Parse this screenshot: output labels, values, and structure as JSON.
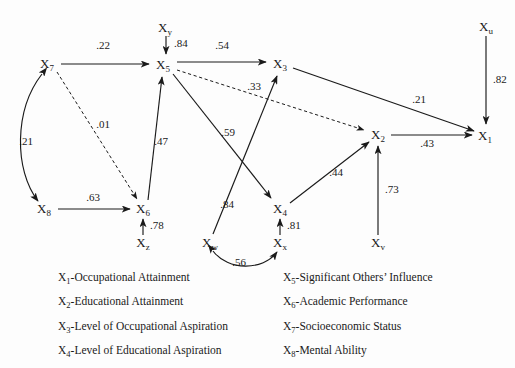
{
  "diagram": {
    "nodes": [
      {
        "id": "X1",
        "base": "X",
        "sub": "1",
        "x": 485,
        "y": 136
      },
      {
        "id": "X2",
        "base": "X",
        "sub": "2",
        "x": 378,
        "y": 135
      },
      {
        "id": "X3",
        "base": "X",
        "sub": "3",
        "x": 280,
        "y": 64
      },
      {
        "id": "X4",
        "base": "X",
        "sub": "4",
        "x": 280,
        "y": 209
      },
      {
        "id": "X5",
        "base": "X",
        "sub": "5",
        "x": 163,
        "y": 65
      },
      {
        "id": "X6",
        "base": "X",
        "sub": "6",
        "x": 143,
        "y": 209
      },
      {
        "id": "X7",
        "base": "X",
        "sub": "7",
        "x": 47,
        "y": 64
      },
      {
        "id": "X8",
        "base": "X",
        "sub": "8",
        "x": 44,
        "y": 209
      },
      {
        "id": "Xu",
        "base": "X",
        "sub": "u",
        "x": 486,
        "y": 27
      },
      {
        "id": "Xv",
        "base": "X",
        "sub": "v",
        "x": 378,
        "y": 243
      },
      {
        "id": "Xw",
        "base": "X",
        "sub": "w",
        "x": 210,
        "y": 243
      },
      {
        "id": "Xx",
        "base": "X",
        "sub": "x",
        "x": 280,
        "y": 243
      },
      {
        "id": "Xy",
        "base": "X",
        "sub": "y",
        "x": 165,
        "y": 28
      },
      {
        "id": "Xz",
        "base": "X",
        "sub": "z",
        "x": 143,
        "y": 243
      }
    ],
    "edges": [
      {
        "from": "X7",
        "to": "X5",
        "coefficient": ".22",
        "style": "solid",
        "arrow": "single",
        "label_x": 103,
        "label_y": 49
      },
      {
        "from": "Xy",
        "to": "X5",
        "coefficient": ".84",
        "style": "solid",
        "arrow": "single",
        "label_x": 174,
        "label_y": 47
      },
      {
        "from": "X5",
        "to": "X3",
        "coefficient": ".54",
        "style": "solid",
        "arrow": "single",
        "label_x": 222,
        "label_y": 49
      },
      {
        "from": "X5",
        "to": "X2",
        "coefficient": ".33",
        "style": "dashed",
        "arrow": "single",
        "label_x": 254,
        "label_y": 90
      },
      {
        "from": "X5",
        "to": "X4",
        "coefficient": ".59",
        "style": "solid",
        "arrow": "single",
        "label_x": 228,
        "label_y": 136
      },
      {
        "from": "X6",
        "to": "X5",
        "coefficient": ".47",
        "style": "solid",
        "arrow": "single",
        "label_x": 161,
        "label_y": 145
      },
      {
        "from": "X7",
        "to": "X6",
        "coefficient": ".01",
        "style": "dashed",
        "arrow": "single",
        "label_x": 103,
        "label_y": 128
      },
      {
        "from": "X7",
        "to": "X8",
        "coefficient": ".21",
        "style": "solid",
        "arrow": "double",
        "label_x": 26,
        "label_y": 145
      },
      {
        "from": "X8",
        "to": "X6",
        "coefficient": ".63",
        "style": "solid",
        "arrow": "single",
        "label_x": 93,
        "label_y": 201
      },
      {
        "from": "Xz",
        "to": "X6",
        "coefficient": ".78",
        "style": "solid",
        "arrow": "single",
        "label_x": 150,
        "label_y": 229
      },
      {
        "from": "Xw",
        "to": "X3",
        "coefficient": ".84",
        "style": "solid",
        "arrow": "single",
        "label_x": 227,
        "label_y": 208
      },
      {
        "from": "Xw",
        "to": "Xx",
        "coefficient": ".56",
        "style": "solid",
        "arrow": "double",
        "label_x": 239,
        "label_y": 266
      },
      {
        "from": "Xx",
        "to": "X4",
        "coefficient": ".81",
        "style": "solid",
        "arrow": "single",
        "label_x": 287,
        "label_y": 229
      },
      {
        "from": "X4",
        "to": "X2",
        "coefficient": ".44",
        "style": "solid",
        "arrow": "single",
        "label_x": 336,
        "label_y": 176
      },
      {
        "from": "Xv",
        "to": "X2",
        "coefficient": ".73",
        "style": "solid",
        "arrow": "single",
        "label_x": 385,
        "label_y": 193
      },
      {
        "from": "X3",
        "to": "X1",
        "coefficient": ".21",
        "style": "solid",
        "arrow": "single",
        "label_x": 419,
        "label_y": 103
      },
      {
        "from": "X2",
        "to": "X1",
        "coefficient": ".43",
        "style": "solid",
        "arrow": "single",
        "label_x": 427,
        "label_y": 147
      },
      {
        "from": "Xu",
        "to": "X1",
        "coefficient": ".82",
        "style": "solid",
        "arrow": "single",
        "label_x": 493,
        "label_y": 83
      }
    ]
  },
  "legend": {
    "left_column": [
      {
        "base": "X",
        "sub": "1",
        "text": "-Occupational Attainment"
      },
      {
        "base": "X",
        "sub": "2",
        "text": "-Educational Attainment"
      },
      {
        "base": "X",
        "sub": "3",
        "text": "-Level of Occupational Aspiration"
      },
      {
        "base": "X",
        "sub": "4",
        "text": "-Level of Educational Aspiration"
      }
    ],
    "right_column": [
      {
        "base": "X",
        "sub": "5",
        "text": "-Significant Others’ Influence"
      },
      {
        "base": "X",
        "sub": "6",
        "text": "-Academic Performance"
      },
      {
        "base": "X",
        "sub": "7",
        "text": "-Socioeconomic Status"
      },
      {
        "base": "X",
        "sub": "8",
        "text": "-Mental Ability"
      }
    ]
  },
  "colors": {
    "ink": "#1a1a1a",
    "background": "#fdfdfd"
  }
}
